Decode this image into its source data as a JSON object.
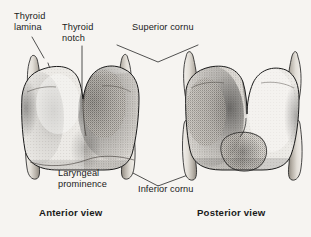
{
  "image": {
    "subject": "Thyroid cartilage",
    "background_color": "#f6f4f1",
    "ink_color": "#1a1a1a",
    "width": 311,
    "height": 237
  },
  "labels": {
    "thyroid_lamina": "Thyroid\nlamina",
    "thyroid_notch": "Thyroid\nnotch",
    "superior_cornu": "Superior cornu",
    "laryngeal_prominence": "Laryngeal\nprominence",
    "inferior_cornu": "Inferior cornu",
    "anterior_view": "Anterior view",
    "posterior_view": "Posterior view"
  },
  "figures": [
    {
      "name": "anterior-view",
      "caption": "Anterior view",
      "parts": [
        "thyroid lamina",
        "thyroid notch",
        "laryngeal prominence",
        "superior cornu",
        "inferior cornu"
      ]
    },
    {
      "name": "posterior-view",
      "caption": "Posterior view",
      "parts": [
        "thyroid lamina",
        "thyroid notch",
        "superior cornu",
        "inferior cornu"
      ]
    }
  ]
}
